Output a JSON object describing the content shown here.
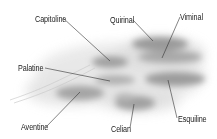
{
  "diagram": {
    "hills": [
      {
        "name": "Capitoline",
        "label_x": 35,
        "label_y": 14,
        "point_x": 110,
        "point_y": 61
      },
      {
        "name": "Quirinal",
        "label_x": 110,
        "label_y": 15,
        "point_x": 153,
        "point_y": 41
      },
      {
        "name": "Viminal",
        "label_x": 180,
        "label_y": 12,
        "point_x": 162,
        "point_y": 58
      },
      {
        "name": "Palatine",
        "label_x": 18,
        "label_y": 63,
        "point_x": 110,
        "point_y": 81
      },
      {
        "name": "Esquiline",
        "label_x": 178,
        "label_y": 114,
        "point_x": 168,
        "point_y": 80
      },
      {
        "name": "Aventine",
        "label_x": 21,
        "label_y": 122,
        "point_x": 80,
        "point_y": 92
      },
      {
        "name": "Celian",
        "label_x": 111,
        "label_y": 124,
        "point_x": 134,
        "point_y": 104
      }
    ]
  }
}
